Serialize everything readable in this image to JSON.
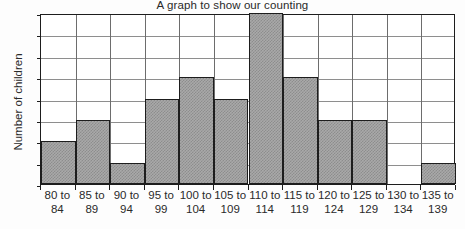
{
  "chart_data": {
    "type": "bar",
    "title": "A graph to show our counting",
    "xlabel": "",
    "ylabel": "Number of children",
    "categories": [
      "80 to 84",
      "85 to 89",
      "90 to 94",
      "95 to 99",
      "100 to 104",
      "105 to 109",
      "110 to 114",
      "115 to 119",
      "120 to 124",
      "125 to 129",
      "130 to 134",
      "135 to 139"
    ],
    "category_lines": [
      {
        "line1": "80 to",
        "line2": "84"
      },
      {
        "line1": "85 to",
        "line2": "89"
      },
      {
        "line1": "90 to",
        "line2": "94"
      },
      {
        "line1": "95 to",
        "line2": "99"
      },
      {
        "line1": "100 to",
        "line2": "104"
      },
      {
        "line1": "105 to",
        "line2": "109"
      },
      {
        "line1": "110 to",
        "line2": "114"
      },
      {
        "line1": "115 to",
        "line2": "119"
      },
      {
        "line1": "120 to",
        "line2": "124"
      },
      {
        "line1": "125 to",
        "line2": "129"
      },
      {
        "line1": "130 to",
        "line2": "134"
      },
      {
        "line1": "135 to",
        "line2": "139"
      }
    ],
    "values": [
      2,
      3,
      1,
      4,
      5,
      4,
      8,
      5,
      3,
      3,
      0,
      1
    ],
    "ylim": [
      0,
      8
    ],
    "yticks": [
      0,
      1,
      2,
      3,
      4,
      5,
      6,
      7,
      8
    ],
    "ytick_labels": [
      "0",
      "1",
      "2",
      "3",
      "4",
      "5",
      "6",
      "7",
      "8"
    ],
    "grid": true,
    "legend": null,
    "bar_fill_color": "#a9a9a9",
    "bar_edge_color": "#1d1d1d",
    "gridline_color": "#8e8e8e",
    "axis_color": "#1d1d1d",
    "background_color": "#fdfdfd"
  }
}
